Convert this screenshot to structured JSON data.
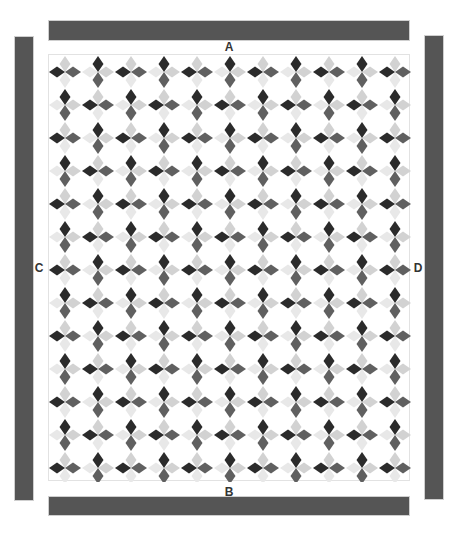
{
  "diagram": {
    "type": "quilt-layout",
    "borders": {
      "top": {
        "label": "A"
      },
      "bottom": {
        "label": "B"
      },
      "left": {
        "label": "C"
      },
      "right": {
        "label": "D"
      }
    },
    "center": {
      "columns": 11,
      "rows": 13,
      "block_pattern": "four-point star, alternating horizontal (H) and vertical (V) orientation in checkerboard",
      "first_block": "H"
    },
    "colors": {
      "border_strip": "#555555",
      "dark": "#2b2b2b",
      "medium": "#606060",
      "light": "#d2d2d2",
      "lighter": "#e8e8e8",
      "background": "#ffffff"
    }
  }
}
